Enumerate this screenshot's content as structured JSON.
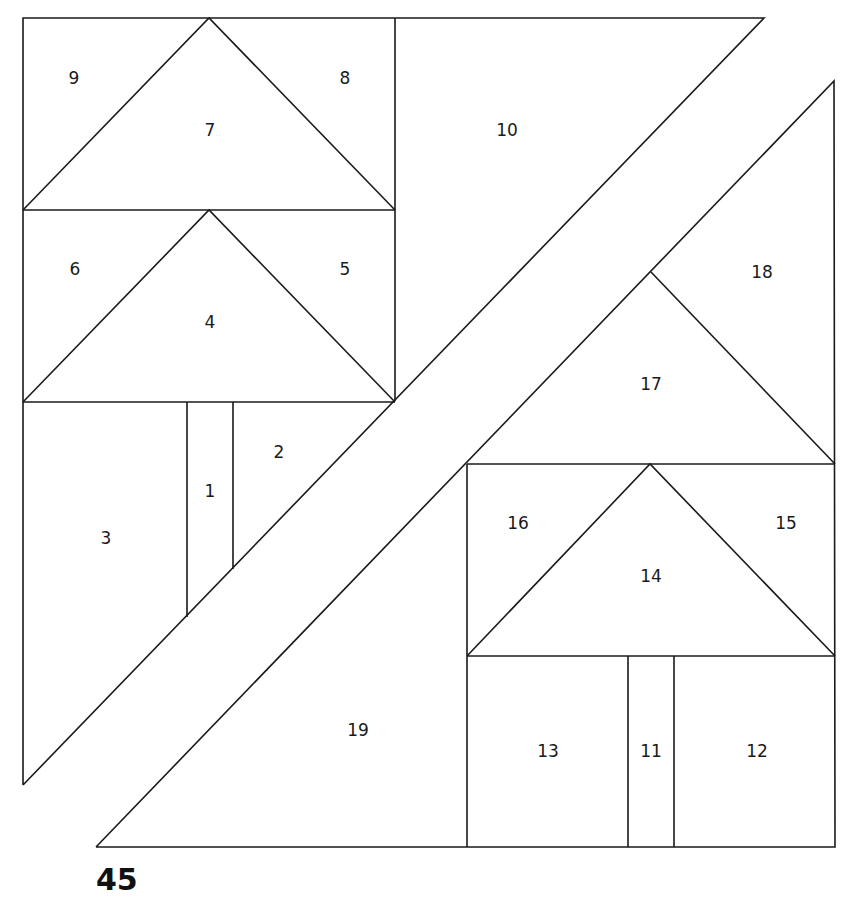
{
  "page_number": "45",
  "diagram": {
    "type": "paper-piecing-pattern",
    "stroke_color": "#1a1a1a",
    "pieces": [
      {
        "id": "1",
        "label": "1",
        "x": 210,
        "y": 492
      },
      {
        "id": "2",
        "label": "2",
        "x": 279,
        "y": 453
      },
      {
        "id": "3",
        "label": "3",
        "x": 106,
        "y": 539
      },
      {
        "id": "4",
        "label": "4",
        "x": 210,
        "y": 323
      },
      {
        "id": "5",
        "label": "5",
        "x": 345,
        "y": 270
      },
      {
        "id": "6",
        "label": "6",
        "x": 75,
        "y": 270
      },
      {
        "id": "7",
        "label": "7",
        "x": 210,
        "y": 131
      },
      {
        "id": "8",
        "label": "8",
        "x": 345,
        "y": 79
      },
      {
        "id": "9",
        "label": "9",
        "x": 74,
        "y": 79
      },
      {
        "id": "10",
        "label": "10",
        "x": 507,
        "y": 131
      },
      {
        "id": "11",
        "label": "11",
        "x": 651,
        "y": 752
      },
      {
        "id": "12",
        "label": "12",
        "x": 757,
        "y": 752
      },
      {
        "id": "13",
        "label": "13",
        "x": 548,
        "y": 752
      },
      {
        "id": "14",
        "label": "14",
        "x": 651,
        "y": 577
      },
      {
        "id": "15",
        "label": "15",
        "x": 786,
        "y": 524
      },
      {
        "id": "16",
        "label": "16",
        "x": 518,
        "y": 524
      },
      {
        "id": "17",
        "label": "17",
        "x": 651,
        "y": 385
      },
      {
        "id": "18",
        "label": "18",
        "x": 762,
        "y": 273
      },
      {
        "id": "19",
        "label": "19",
        "x": 358,
        "y": 731
      }
    ]
  }
}
